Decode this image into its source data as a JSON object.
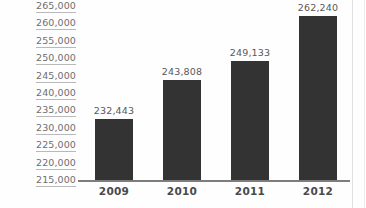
{
  "chart_data": {
    "type": "bar",
    "title": "",
    "subtitle": "",
    "xlabel": "",
    "ylabel": "",
    "categories": [
      "2009",
      "2010",
      "2011",
      "2012"
    ],
    "values": [
      232443,
      243808,
      249133,
      262240
    ],
    "value_labels": [
      "232,443",
      "243,808",
      "249,133",
      "262,240"
    ],
    "ylim": [
      215000,
      265000
    ],
    "ytick_step": 5000,
    "ytick_labels": [
      "265,000",
      "260,000",
      "255,000",
      "250,000",
      "245,000",
      "240,000",
      "235,000",
      "230,000",
      "225,000",
      "220,000",
      "215,000"
    ],
    "grid": false,
    "gridline_style": "underlined-tick-labels",
    "legend": "none",
    "legend_position": "none",
    "bar_color": "#333333",
    "axis_color": "#7d7d7d",
    "tick_label_color": "#6f6f6f",
    "value_label_color": "#585858",
    "category_label_color": "#4a4a4a",
    "background_color": "#fefefe"
  }
}
